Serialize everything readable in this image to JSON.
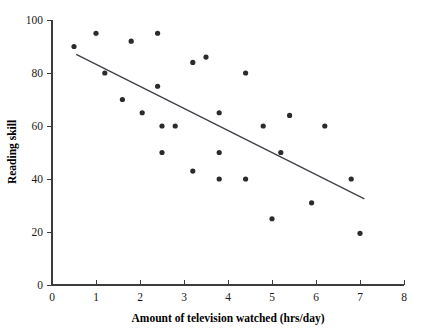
{
  "chart_data": {
    "type": "scatter",
    "title": "",
    "xlabel": "Amount of television watched (hrs/day)",
    "ylabel": "Reading skill",
    "xlim": [
      0,
      8
    ],
    "ylim": [
      0,
      100
    ],
    "xticks": [
      0,
      1,
      2,
      3,
      4,
      5,
      6,
      7,
      8
    ],
    "yticks": [
      0,
      20,
      40,
      60,
      80,
      100
    ],
    "xtick_labels": [
      "0",
      "1",
      "2",
      "3",
      "4",
      "5",
      "6",
      "7",
      "8"
    ],
    "ytick_labels": [
      "0",
      "20",
      "40",
      "60",
      "80",
      "100"
    ],
    "grid": false,
    "legend": false,
    "legend_position": "none",
    "marker": "circle",
    "marker_color": "#2b2b2b",
    "marker_size": 3,
    "axis_color": "#3b3b3b",
    "points": [
      {
        "x": 0.5,
        "y": 90
      },
      {
        "x": 1.0,
        "y": 95
      },
      {
        "x": 1.2,
        "y": 80
      },
      {
        "x": 1.6,
        "y": 70
      },
      {
        "x": 1.8,
        "y": 92
      },
      {
        "x": 2.05,
        "y": 65
      },
      {
        "x": 2.4,
        "y": 95
      },
      {
        "x": 2.4,
        "y": 75
      },
      {
        "x": 2.5,
        "y": 60
      },
      {
        "x": 2.5,
        "y": 50
      },
      {
        "x": 2.8,
        "y": 60
      },
      {
        "x": 3.2,
        "y": 84
      },
      {
        "x": 3.2,
        "y": 43
      },
      {
        "x": 3.5,
        "y": 86
      },
      {
        "x": 3.8,
        "y": 65
      },
      {
        "x": 3.8,
        "y": 50
      },
      {
        "x": 3.8,
        "y": 40
      },
      {
        "x": 4.4,
        "y": 80
      },
      {
        "x": 4.4,
        "y": 40
      },
      {
        "x": 4.8,
        "y": 60
      },
      {
        "x": 5.0,
        "y": 25
      },
      {
        "x": 5.2,
        "y": 50
      },
      {
        "x": 5.4,
        "y": 64
      },
      {
        "x": 5.9,
        "y": 31
      },
      {
        "x": 6.2,
        "y": 60
      },
      {
        "x": 6.8,
        "y": 40
      },
      {
        "x": 7.0,
        "y": 19.5
      }
    ],
    "trend_line": {
      "x1": 0.55,
      "y1": 87,
      "x2": 7.1,
      "y2": 32.5,
      "color": "#3f3f46"
    }
  }
}
